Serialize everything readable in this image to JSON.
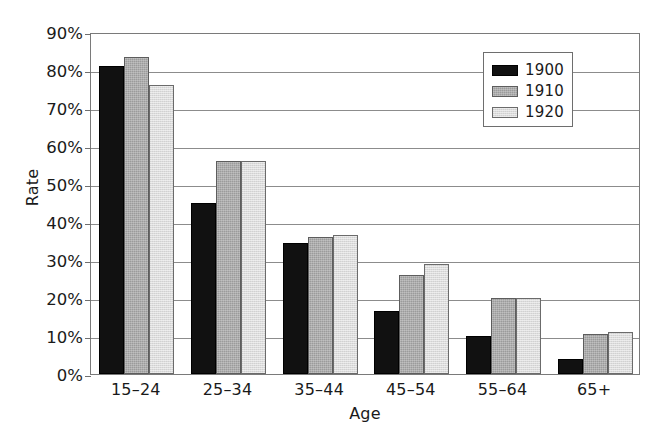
{
  "chart_data": {
    "type": "bar",
    "title": "",
    "xlabel": "Age",
    "ylabel": "Rate",
    "categories": [
      "15–24",
      "25–34",
      "35–44",
      "45–54",
      "55–64",
      "65+"
    ],
    "series": [
      {
        "name": "1900",
        "color": "#111111",
        "values": [
          81,
          45,
          34.5,
          16.5,
          10,
          4
        ]
      },
      {
        "name": "1910",
        "color": "#9b9b9b",
        "values": [
          83.5,
          56,
          36,
          26,
          20,
          10.5
        ]
      },
      {
        "name": "1920",
        "color": "#dcdcdc",
        "values": [
          76,
          56,
          36.5,
          29,
          20,
          11
        ]
      }
    ],
    "ylim": [
      0,
      90
    ],
    "ytick_values": [
      0,
      10,
      20,
      30,
      40,
      50,
      60,
      70,
      80,
      90
    ],
    "ytick_labels": [
      "0%",
      "10%",
      "20%",
      "30%",
      "40%",
      "50%",
      "60%",
      "70%",
      "80%",
      "90%"
    ],
    "grid": true,
    "grid_axis": "y",
    "legend_position": "upper right",
    "legend_entries": [
      "1900",
      "1910",
      "1920"
    ]
  },
  "axes": {
    "y_title": "Rate",
    "x_title": "Age"
  }
}
